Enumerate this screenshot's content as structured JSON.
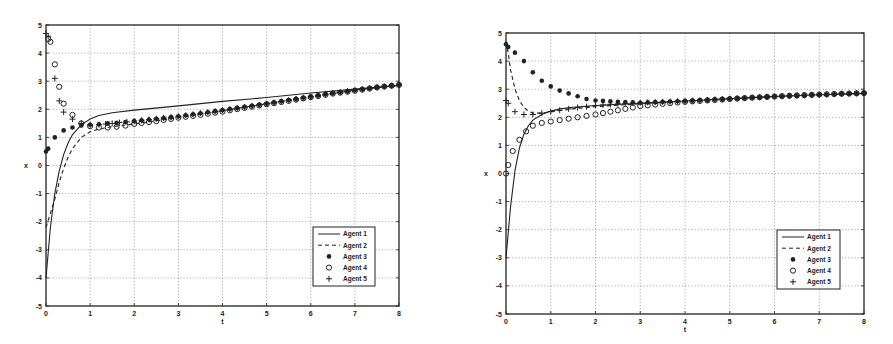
{
  "chart_data": [
    {
      "type": "line",
      "title": "",
      "xlabel": "t",
      "ylabel": "x",
      "xlim": [
        0,
        8
      ],
      "ylim": [
        -5,
        5
      ],
      "xticks": [
        "0",
        "1",
        "2",
        "3",
        "4",
        "5",
        "6",
        "7",
        "8"
      ],
      "yticks": [
        "-5",
        "-4",
        "-3",
        "-2",
        "-1",
        "0",
        "1",
        "2",
        "3",
        "4",
        "5"
      ],
      "grid": true,
      "legend_position": "lower right",
      "legend": [
        "Agent 1",
        "Agent 2",
        "Agent 3",
        "Agent 4",
        "Agent 5"
      ],
      "series": [
        {
          "name": "Agent 1",
          "style": "solid",
          "x": [
            0,
            0.1,
            0.2,
            0.3,
            0.4,
            0.5,
            0.6,
            0.8,
            1.0,
            1.2,
            1.5,
            2.0,
            3.0,
            4.0,
            5.0,
            6.0,
            7.0,
            8.0
          ],
          "y": [
            -4.0,
            -2.2,
            -1.0,
            -0.2,
            0.4,
            0.8,
            1.1,
            1.45,
            1.65,
            1.78,
            1.88,
            1.97,
            2.12,
            2.28,
            2.42,
            2.58,
            2.72,
            2.85
          ]
        },
        {
          "name": "Agent 2",
          "style": "dashed",
          "x": [
            0,
            0.1,
            0.2,
            0.3,
            0.4,
            0.5,
            0.6,
            0.8,
            1.0,
            1.2,
            1.5,
            2.0,
            3.0,
            4.0,
            5.0,
            6.0,
            7.0,
            8.0
          ],
          "y": [
            -2.2,
            -1.7,
            -1.2,
            -0.6,
            -0.1,
            0.3,
            0.6,
            1.0,
            1.2,
            1.3,
            1.38,
            1.48,
            1.7,
            1.95,
            2.2,
            2.45,
            2.68,
            2.85
          ]
        },
        {
          "name": "Agent 3",
          "style": "filled-dot",
          "x": [
            0,
            0.05,
            0.2,
            0.4,
            0.6,
            0.8,
            1.0,
            1.2,
            1.4,
            1.6,
            1.8,
            2.0,
            2.5,
            3.0,
            3.5,
            4.0,
            4.5,
            5.0,
            5.5,
            6.0,
            6.5,
            7.0,
            7.5,
            8.0
          ],
          "y": [
            0.5,
            0.6,
            1.0,
            1.25,
            1.35,
            1.42,
            1.45,
            1.47,
            1.5,
            1.52,
            1.55,
            1.58,
            1.66,
            1.75,
            1.86,
            1.97,
            2.09,
            2.2,
            2.33,
            2.45,
            2.58,
            2.68,
            2.78,
            2.87
          ]
        },
        {
          "name": "Agent 4",
          "style": "open-circle",
          "x": [
            0.05,
            0.1,
            0.2,
            0.3,
            0.4,
            0.6,
            0.8,
            1.0,
            1.2,
            1.4,
            1.6,
            1.8,
            2.0,
            2.5,
            3.0,
            3.5,
            4.0,
            4.5,
            5.0,
            5.5,
            6.0,
            6.5,
            7.0,
            7.5,
            8.0
          ],
          "y": [
            4.5,
            4.4,
            3.6,
            2.8,
            2.2,
            1.8,
            1.5,
            1.4,
            1.35,
            1.35,
            1.38,
            1.42,
            1.48,
            1.58,
            1.7,
            1.8,
            1.92,
            2.05,
            2.18,
            2.3,
            2.43,
            2.56,
            2.66,
            2.78,
            2.87
          ]
        },
        {
          "name": "Agent 5",
          "style": "plus",
          "x": [
            0,
            0.05,
            0.2,
            0.3,
            0.4,
            0.6,
            0.8,
            1.0,
            1.2,
            1.5,
            2.0,
            3.0,
            4.0,
            5.0,
            6.0,
            7.0,
            8.0
          ],
          "y": [
            4.7,
            4.6,
            3.1,
            2.3,
            1.9,
            1.65,
            1.5,
            1.45,
            1.45,
            1.5,
            1.58,
            1.75,
            1.97,
            2.2,
            2.45,
            2.68,
            2.87
          ]
        }
      ]
    },
    {
      "type": "line",
      "title": "",
      "xlabel": "t",
      "ylabel": "x",
      "xlim": [
        0,
        8
      ],
      "ylim": [
        -5,
        5
      ],
      "xticks": [
        "0",
        "1",
        "2",
        "3",
        "4",
        "5",
        "6",
        "7",
        "8"
      ],
      "yticks": [
        "-5",
        "-4",
        "-3",
        "-2",
        "-1",
        "0",
        "1",
        "2",
        "3",
        "4",
        "5"
      ],
      "grid": true,
      "legend_position": "lower right",
      "legend": [
        "Agent 1",
        "Agent 2",
        "Agent 3",
        "Agent 4",
        "Agent 5"
      ],
      "series": [
        {
          "name": "Agent 1",
          "style": "solid",
          "x": [
            0,
            0.1,
            0.2,
            0.3,
            0.4,
            0.5,
            0.6,
            0.8,
            1.0,
            1.2,
            1.5,
            2.0,
            3.0,
            4.0,
            5.0,
            6.0,
            7.0,
            8.0
          ],
          "y": [
            -3.0,
            -1.2,
            0.1,
            0.9,
            1.4,
            1.7,
            1.9,
            2.1,
            2.22,
            2.3,
            2.36,
            2.42,
            2.5,
            2.58,
            2.66,
            2.74,
            2.8,
            2.85
          ]
        },
        {
          "name": "Agent 2",
          "style": "dashed",
          "x": [
            0,
            0.05,
            0.1,
            0.2,
            0.3,
            0.4,
            0.5,
            0.6,
            0.8,
            1.0,
            1.5,
            2.0,
            3.0,
            4.0,
            5.0,
            6.0,
            7.0,
            8.0
          ],
          "y": [
            4.7,
            4.3,
            3.7,
            3.0,
            2.6,
            2.35,
            2.22,
            2.15,
            2.15,
            2.2,
            2.3,
            2.38,
            2.48,
            2.58,
            2.66,
            2.74,
            2.8,
            2.85
          ]
        },
        {
          "name": "Agent 3",
          "style": "filled-dot",
          "x": [
            0,
            0.05,
            0.2,
            0.4,
            0.6,
            0.8,
            1.0,
            1.2,
            1.4,
            1.6,
            1.8,
            2.0,
            2.5,
            3.0,
            3.5,
            4.0,
            4.5,
            5.0,
            5.5,
            6.0,
            6.5,
            7.0,
            7.5,
            8.0
          ],
          "y": [
            4.6,
            4.5,
            4.3,
            4.0,
            3.6,
            3.3,
            3.1,
            2.95,
            2.85,
            2.75,
            2.65,
            2.6,
            2.55,
            2.52,
            2.55,
            2.58,
            2.62,
            2.66,
            2.7,
            2.74,
            2.77,
            2.8,
            2.83,
            2.86
          ]
        },
        {
          "name": "Agent 4",
          "style": "open-circle",
          "x": [
            0,
            0.05,
            0.15,
            0.3,
            0.45,
            0.6,
            0.8,
            1.0,
            1.2,
            1.4,
            1.6,
            1.8,
            2.0,
            2.5,
            3.0,
            3.5,
            4.0,
            4.5,
            5.0,
            5.5,
            6.0,
            6.5,
            7.0,
            7.5,
            8.0
          ],
          "y": [
            0.0,
            0.3,
            0.8,
            1.2,
            1.5,
            1.7,
            1.8,
            1.85,
            1.9,
            1.95,
            2.0,
            2.05,
            2.1,
            2.25,
            2.4,
            2.48,
            2.55,
            2.6,
            2.65,
            2.7,
            2.74,
            2.78,
            2.81,
            2.84,
            2.86
          ]
        },
        {
          "name": "Agent 5",
          "style": "plus",
          "x": [
            0,
            0.05,
            0.2,
            0.4,
            0.6,
            0.8,
            1.0,
            1.2,
            1.4,
            1.6,
            1.8,
            2.0,
            2.5,
            3.0,
            4.0,
            5.0,
            6.0,
            7.0,
            8.0
          ],
          "y": [
            2.6,
            2.5,
            2.2,
            2.1,
            2.1,
            2.15,
            2.2,
            2.25,
            2.3,
            2.35,
            2.38,
            2.42,
            2.48,
            2.52,
            2.58,
            2.66,
            2.74,
            2.8,
            2.86
          ]
        }
      ]
    }
  ],
  "panels": [
    {
      "px": {
        "x0": 46,
        "x1": 399,
        "y0": 306,
        "y1": 25
      },
      "legend_box": {
        "x": 313,
        "y": 227,
        "w": 62,
        "h": 59
      }
    },
    {
      "px": {
        "x0": 506,
        "x1": 864,
        "y0": 314,
        "y1": 33
      },
      "legend_box": {
        "x": 777,
        "y": 230,
        "w": 63,
        "h": 59
      }
    }
  ]
}
